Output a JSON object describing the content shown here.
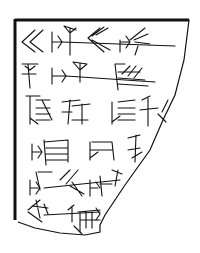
{
  "figure": {
    "lines_of_text": 6,
    "ink_color": "#111111",
    "background": "#ffffff"
  }
}
